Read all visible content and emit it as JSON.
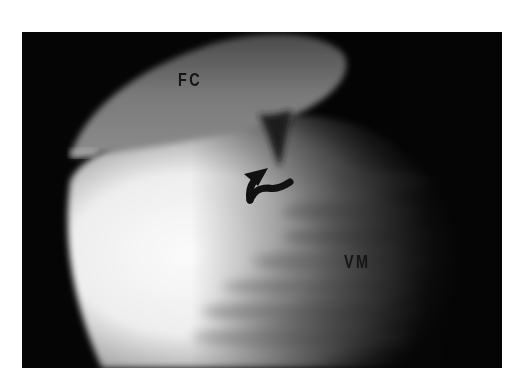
{
  "image": {
    "description": "Grayscale arthroscopic view showing femoral condyle above and vastus medialis / soft tissue below, with curved arrow indicating a cleft",
    "labels": [
      {
        "id": "fc",
        "text": "FC"
      },
      {
        "id": "vm",
        "text": "VM"
      }
    ],
    "annotation": {
      "type": "curved-arrow",
      "color": "#111111"
    },
    "colors": {
      "background": "#ffffff",
      "frame": "#050505",
      "bright_tissue": "#f4f4f4",
      "condyle": "#6e6e6e"
    }
  }
}
